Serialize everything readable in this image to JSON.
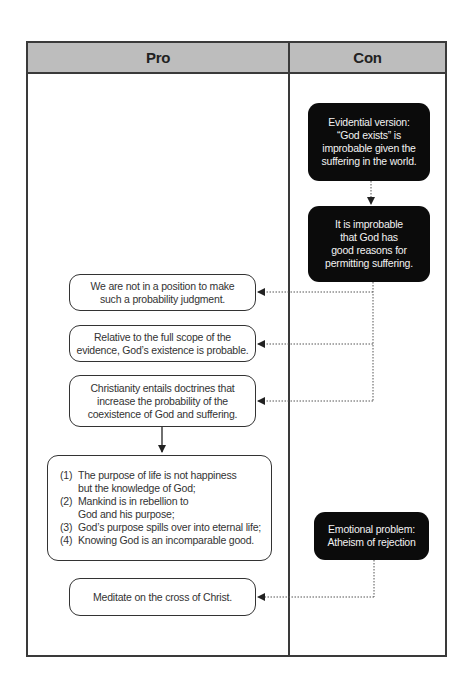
{
  "header": {
    "pro_label": "Pro",
    "con_label": "Con"
  },
  "con": {
    "evidential": "Evidential version:\n“God exists” is\nimprobable given the\nsuffering in the world.",
    "improbable_reasons": "It is improbable\nthat God has\ngood reasons for\npermitting suffering.",
    "emotional": "Emotional problem:\nAtheism of rejection"
  },
  "pro": {
    "not_in_position": "We are not in a position to make\nsuch a probability judgment.",
    "full_scope": "Relative to the full scope of the\nevidence, God’s existence is probable.",
    "christianity_doctrines": "Christianity entails doctrines that\nincrease the probability of the\ncoexistence of God and suffering.",
    "doctrines": [
      {
        "num": "(1)",
        "text": "The purpose of life is not happiness\nbut the knowledge of God;"
      },
      {
        "num": "(2)",
        "text": "Mankind is in rebellion to\nGod and his purpose;"
      },
      {
        "num": "(3)",
        "text": "God’s purpose spills over into eternal life;"
      },
      {
        "num": "(4)",
        "text": "Knowing God is an incomparable good."
      }
    ],
    "meditate": "Meditate on the cross of Christ."
  },
  "colors": {
    "header_bg": "#bdbdbd",
    "border": "#3a3a3a",
    "con_box_bg": "#0b0b0b",
    "con_box_text": "#f2f2f2",
    "pro_box_text": "#333333"
  }
}
